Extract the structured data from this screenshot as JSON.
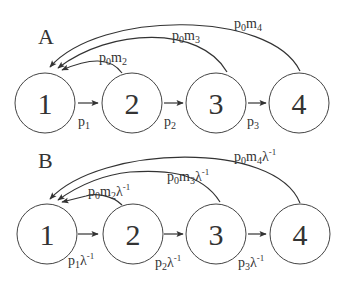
{
  "diagram": {
    "type": "state-transition",
    "panels": [
      {
        "label": "A",
        "nodes": [
          "1",
          "2",
          "3",
          "4"
        ],
        "forward_edges": [
          {
            "from": "1",
            "to": "2",
            "label_base": "p",
            "label_sub": "1",
            "label_sup": ""
          },
          {
            "from": "2",
            "to": "3",
            "label_base": "p",
            "label_sub": "2",
            "label_sup": ""
          },
          {
            "from": "3",
            "to": "4",
            "label_base": "p",
            "label_sub": "3",
            "label_sup": ""
          }
        ],
        "return_edges": [
          {
            "from": "2",
            "to": "1",
            "label": "p0m2",
            "p_sub": "0",
            "m_sub": "2",
            "lambda": ""
          },
          {
            "from": "3",
            "to": "1",
            "label": "p0m3",
            "p_sub": "0",
            "m_sub": "3",
            "lambda": ""
          },
          {
            "from": "4",
            "to": "1",
            "label": "p0m4",
            "p_sub": "0",
            "m_sub": "4",
            "lambda": ""
          }
        ]
      },
      {
        "label": "B",
        "nodes": [
          "1",
          "2",
          "3",
          "4"
        ],
        "forward_edges": [
          {
            "from": "1",
            "to": "2",
            "label_base": "p",
            "label_sub": "1",
            "label_sup": "λ",
            "exp": "-1"
          },
          {
            "from": "2",
            "to": "3",
            "label_base": "p",
            "label_sub": "2",
            "label_sup": "λ",
            "exp": "-1"
          },
          {
            "from": "3",
            "to": "4",
            "label_base": "p",
            "label_sub": "3",
            "label_sup": "λ",
            "exp": "-1"
          }
        ],
        "return_edges": [
          {
            "from": "2",
            "to": "1",
            "label": "p0m2λ-1",
            "p_sub": "0",
            "m_sub": "2",
            "lambda": "λ",
            "exp": "-1"
          },
          {
            "from": "3",
            "to": "1",
            "label": "p0m3λ-1",
            "p_sub": "0",
            "m_sub": "3",
            "lambda": "λ",
            "exp": "-1"
          },
          {
            "from": "4",
            "to": "1",
            "label": "p0m4λ-1",
            "p_sub": "0",
            "m_sub": "4",
            "lambda": "λ",
            "exp": "-1"
          }
        ]
      }
    ],
    "colors": {
      "stroke": "#333333",
      "background": "#ffffff"
    }
  }
}
